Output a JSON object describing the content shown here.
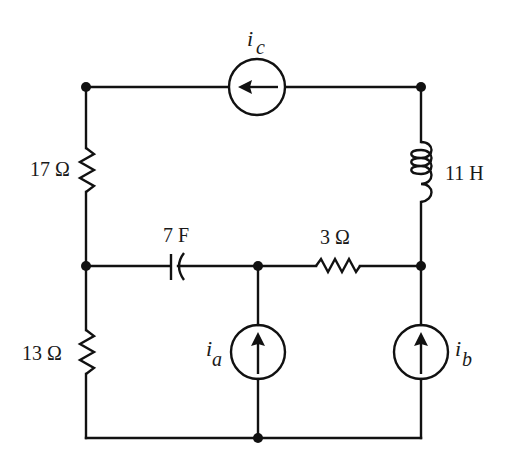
{
  "diagram": {
    "type": "circuit-schematic",
    "components": {
      "current_source_c": {
        "label": "i",
        "subscript": "c",
        "direction": "left"
      },
      "resistor_17": {
        "value": "17",
        "unit": "Ω"
      },
      "inductor_11": {
        "value": "11",
        "unit": "H"
      },
      "capacitor_7": {
        "value": "7",
        "unit": "F"
      },
      "resistor_3": {
        "value": "3",
        "unit": "Ω"
      },
      "resistor_13": {
        "value": "13",
        "unit": "Ω"
      },
      "current_source_a": {
        "label": "i",
        "subscript": "a",
        "direction": "up"
      },
      "current_source_b": {
        "label": "i",
        "subscript": "b",
        "direction": "up"
      }
    },
    "labels": {
      "ic_main": "i",
      "ic_sub": "c",
      "r17": "17 Ω",
      "l11": "11 H",
      "c7": "7 F",
      "r3": "3 Ω",
      "r13": "13 Ω",
      "ia_main": "i",
      "ia_sub": "a",
      "ib_main": "i",
      "ib_sub": "b"
    },
    "nodes": [
      "top-left",
      "top-right",
      "mid-left",
      "mid-center",
      "mid-right",
      "bottom-center"
    ],
    "colors": {
      "line": "#111111",
      "background": "#ffffff"
    }
  }
}
